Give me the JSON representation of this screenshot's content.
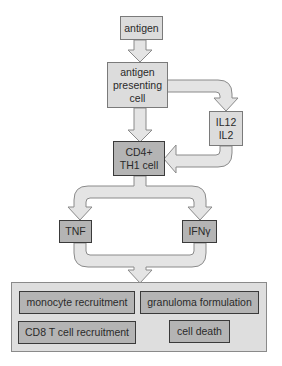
{
  "diagram": {
    "type": "flowchart",
    "colors": {
      "light_box_fill": "#dcdcdc",
      "dark_box_fill": "#b4b4b4",
      "arrow_fill": "#e4e4e4",
      "panel_fill": "#dedede"
    },
    "nodes": {
      "antigen": {
        "lines": [
          "antigen"
        ]
      },
      "apc": {
        "lines": [
          "antigen",
          "presenting",
          "cell"
        ]
      },
      "cytokines_in": {
        "lines": [
          "IL12",
          "IL2"
        ]
      },
      "cd4": {
        "lines": [
          "CD4+",
          "TH1 cell"
        ]
      },
      "tnf": {
        "lines": [
          "TNF"
        ]
      },
      "ifn": {
        "lines": [
          "IFNγ"
        ]
      }
    },
    "outcomes": [
      {
        "label": "monocyte recruitment"
      },
      {
        "label": "granuloma formulation"
      },
      {
        "label": "CD8 T cell recruitment"
      },
      {
        "label": "cell death"
      }
    ],
    "edges": [
      {
        "from": "antigen",
        "to": "apc"
      },
      {
        "from": "apc",
        "to": "cytokines_in"
      },
      {
        "from": "apc",
        "to": "cd4"
      },
      {
        "from": "cytokines_in",
        "to": "cd4"
      },
      {
        "from": "cd4",
        "to": "tnf"
      },
      {
        "from": "cd4",
        "to": "ifn"
      },
      {
        "from": "tnf",
        "to": "outcomes"
      },
      {
        "from": "ifn",
        "to": "outcomes"
      }
    ]
  }
}
